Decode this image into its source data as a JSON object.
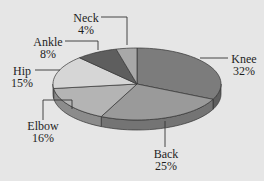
{
  "chart_data": {
    "type": "pie",
    "style": "3d",
    "title": "",
    "categories": [
      "Knee",
      "Back",
      "Elbow",
      "Hip",
      "Ankle",
      "Neck"
    ],
    "values": [
      32,
      25,
      16,
      15,
      8,
      4
    ],
    "unit": "%",
    "slices": [
      {
        "label": "Knee",
        "value": 32,
        "display": "32%",
        "color": "#7c7c7c",
        "side": "#5e5e5e"
      },
      {
        "label": "Back",
        "value": 25,
        "display": "25%",
        "color": "#9a9a9a",
        "side": "#747474"
      },
      {
        "label": "Elbow",
        "value": 16,
        "display": "16%",
        "color": "#b4b4b4",
        "side": "#8c8c8c"
      },
      {
        "label": "Hip",
        "value": 15,
        "display": "15%",
        "color": "#d6d6d6",
        "side": "#acacac"
      },
      {
        "label": "Ankle",
        "value": 8,
        "display": "8%",
        "color": "#5e5e5e",
        "side": "#454545"
      },
      {
        "label": "Neck",
        "value": 4,
        "display": "4%",
        "color": "#a8a8a8",
        "side": "#808080"
      }
    ],
    "legend": "none (callout labels)"
  },
  "labels": {
    "knee": {
      "name": "Knee",
      "pct": "32%"
    },
    "back": {
      "name": "Back",
      "pct": "25%"
    },
    "elbow": {
      "name": "Elbow",
      "pct": "16%"
    },
    "hip": {
      "name": "Hip",
      "pct": "15%"
    },
    "ankle": {
      "name": "Ankle",
      "pct": "8%"
    },
    "neck": {
      "name": "Neck",
      "pct": "4%"
    }
  }
}
